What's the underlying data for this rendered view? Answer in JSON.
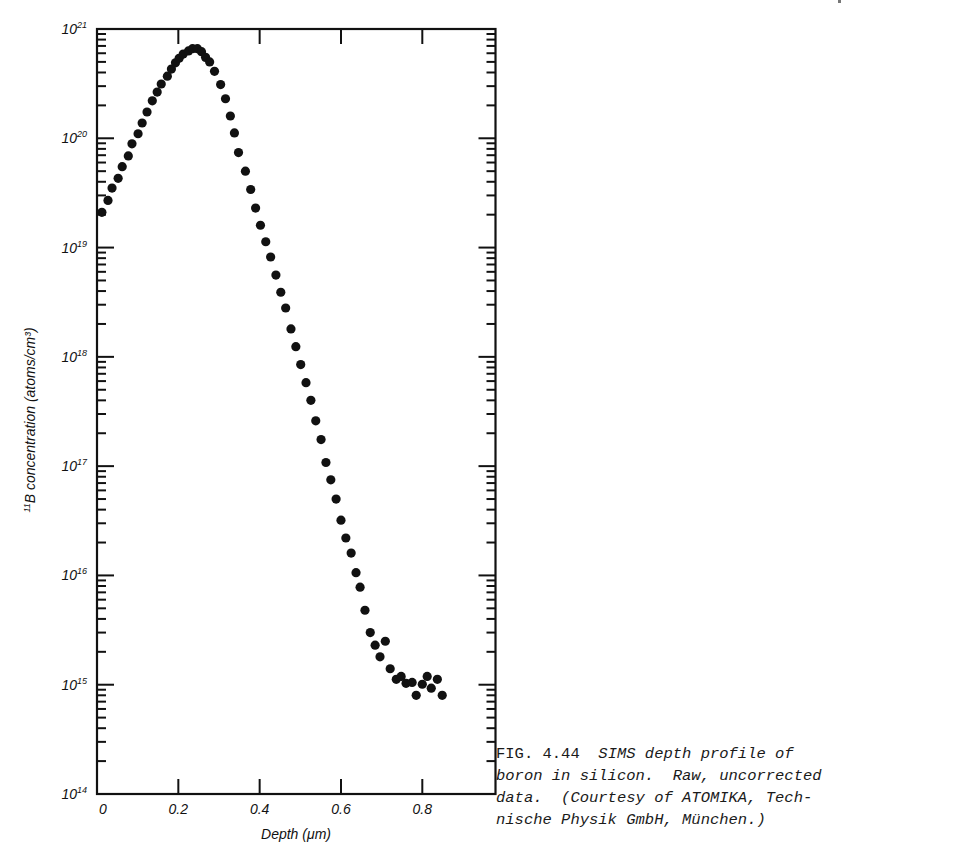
{
  "figure": {
    "caption": {
      "number": "FIG. 4.44",
      "line1_italic": "SIMS depth profile of",
      "line2": "boron in silicon.  Raw, uncorrected",
      "line3": "data.  (Courtesy of ATOMIKA, Tech-",
      "line4": "nische Physik GmbH, München.)"
    }
  },
  "chart_data": {
    "type": "scatter",
    "xlabel": "Depth (μm)",
    "ylabel_prefix": "11",
    "ylabel": "B concentration (atoms/cm³)",
    "yscale": "log",
    "xlim": [
      0,
      0.98
    ],
    "ylim": [
      100000000000000.0,
      1e+21
    ],
    "x_ticks": [
      0,
      0.2,
      0.4,
      0.6,
      0.8
    ],
    "x_tick_labels": [
      "0",
      "0.2",
      "0.4",
      "0.6",
      "0.8"
    ],
    "y_ticks_exp": [
      14,
      15,
      16,
      17,
      18,
      19,
      20,
      21
    ],
    "y_tick_labels": [
      "10^14",
      "10^15",
      "10^16",
      "10^17",
      "10^18",
      "10^19",
      "10^20",
      "10^21"
    ],
    "grid": false,
    "legend": null,
    "marker_color": "#111111",
    "series": [
      {
        "name": "11B",
        "x": [
          0.012,
          0.027,
          0.037,
          0.052,
          0.062,
          0.077,
          0.086,
          0.101,
          0.111,
          0.123,
          0.136,
          0.148,
          0.158,
          0.173,
          0.183,
          0.193,
          0.202,
          0.212,
          0.225,
          0.235,
          0.247,
          0.257,
          0.267,
          0.277,
          0.289,
          0.304,
          0.316,
          0.328,
          0.338,
          0.348,
          0.365,
          0.378,
          0.39,
          0.402,
          0.415,
          0.427,
          0.44,
          0.452,
          0.464,
          0.477,
          0.489,
          0.501,
          0.514,
          0.526,
          0.538,
          0.551,
          0.563,
          0.575,
          0.588,
          0.6,
          0.612,
          0.625,
          0.637,
          0.647,
          0.659,
          0.672,
          0.684,
          0.696,
          0.709,
          0.721,
          0.736,
          0.748,
          0.76,
          0.775,
          0.785,
          0.8,
          0.812,
          0.822,
          0.837,
          0.849
        ],
        "y": [
          2.1e+19,
          2.7e+19,
          3.5e+19,
          4.3e+19,
          5.5e+19,
          6.9e+19,
          8.9e+19,
          1.1e+20,
          1.38e+20,
          1.74e+20,
          2.2e+20,
          2.65e+20,
          3.14e+20,
          3.7e+20,
          4.3e+20,
          4.9e+20,
          5.4e+20,
          5.9e+20,
          6.3e+20,
          6.6e+20,
          6.6e+20,
          6.2e+20,
          5.5e+20,
          5e+20,
          4.1e+20,
          3.1e+20,
          2.3e+20,
          1.6e+20,
          1.12e+20,
          7.4e+19,
          5e+19,
          3.4e+19,
          2.3e+19,
          1.6e+19,
          1.13e+19,
          8.2e+18,
          5.6e+18,
          3.9e+18,
          2.8e+18,
          1.8e+18,
          1.24e+18,
          8.5e+17,
          5.8e+17,
          4e+17,
          2.6e+17,
          1.75e+17,
          1.08e+17,
          7.5e+16,
          5e+16,
          3.2e+16,
          2.2e+16,
          1.6e+16,
          1.06e+16,
          7800000000000000.0,
          4800000000000000.0,
          3000000000000000.0,
          2300000000000000.0,
          1800000000000000.0,
          2500000000000000.0,
          1400000000000000.0,
          1120000000000000.0,
          1190000000000000.0,
          1030000000000000.0,
          1050000000000000.0,
          800000000000000.0,
          1010000000000000.0,
          1190000000000000.0,
          930000000000000.0,
          1120000000000000.0,
          800000000000000.0
        ]
      }
    ]
  }
}
